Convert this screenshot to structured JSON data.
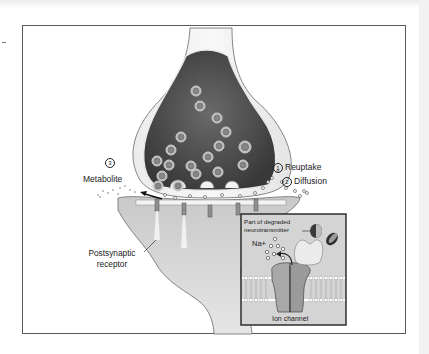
{
  "figure": {
    "type": "synapse-neurotransmitter-termination",
    "colors": {
      "frame_border": "#5a5a5a",
      "neuron_fill": "#e2e2e2",
      "terminal_interior": "#4a4a4a",
      "vesicle": "#b8b8b8",
      "inset_background": "#d4d4d4",
      "inset_border": "#222222"
    }
  },
  "labels": {
    "metabolite": {
      "number": "3",
      "text": "Metabolite"
    },
    "reuptake": {
      "number": "1",
      "text": "Reuptake"
    },
    "diffusion": {
      "number": "2",
      "text": "Diffusion"
    },
    "postsynaptic_receptor": {
      "line1": "Postsynaptic",
      "line2": "receptor"
    }
  },
  "inset": {
    "degraded_label_line1": "Part of degraded",
    "degraded_label_line2": "neurotransmitter",
    "ion_label": "Na+",
    "channel_label": "Ion channel"
  }
}
